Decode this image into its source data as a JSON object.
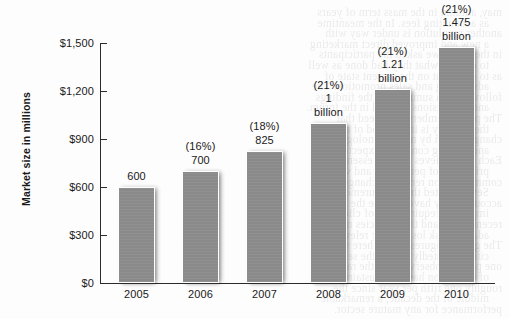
{
  "chart_data": {
    "type": "bar",
    "title": "",
    "xlabel": "",
    "ylabel": "Market size in millions",
    "categories": [
      "2005",
      "2006",
      "2007",
      "2008",
      "2009",
      "2010"
    ],
    "values": [
      600,
      700,
      825,
      1000,
      1210,
      1475
    ],
    "value_labels": [
      "600",
      "(16%)\n700",
      "(18%)\n825",
      "(21%)\n1\nbillion",
      "(21%)\n1.21\nbillion",
      "(21%)\n1.475\nbillion"
    ],
    "growth_rates": [
      null,
      "16%",
      "18%",
      "21%",
      "21%",
      "21%"
    ],
    "ylim": [
      0,
      1500
    ],
    "ytick_values": [
      0,
      300,
      600,
      900,
      1200,
      1500
    ],
    "ytick_labels": [
      "$0",
      "$300",
      "$600",
      "$900",
      "$1,200",
      "$1,500"
    ],
    "grid": false,
    "legend": false,
    "bar_color": "#8a8a8a",
    "bar_border_color": "#ffffff",
    "axis_color": "#2b2b2b"
  },
  "bleed_through_lines": [
    "may, autumn in the mass term of years",
    "as accounting fees. In the meantime",
    "another revolution is under way with",
    "a new and improved direct marketing",
    "in the forum we asked the participants",
    "to explain what they had done as well",
    "as to comment on the current state of",
    "advertising and sales promotion. The",
    "following is a summary of the findings",
    "and conclusions reached in the forum.",
    "The panel members all agreed that",
    "the industry is in a period of rapid",
    "change driven by new technologies",
    "and shifting consumer expectations.",
    "Each still believes that the essential",
    "principles of persuasion and value",
    "communication remain unchanged.",
    "Several noted that measurement and",
    "accountability have become the most",
    "important requirements of clients in",
    "recent years, and that agencies must",
    "adapt or risk losing their relevance.",
    "The growth figures shown here were",
    "cited repeatedly during the session.",
    "one panelist observed that the rate",
    "of expansion has been sustained at",
    "roughly one fifth per year since the",
    "middle of the decade, a remarkable",
    "performance for any mature sector."
  ]
}
